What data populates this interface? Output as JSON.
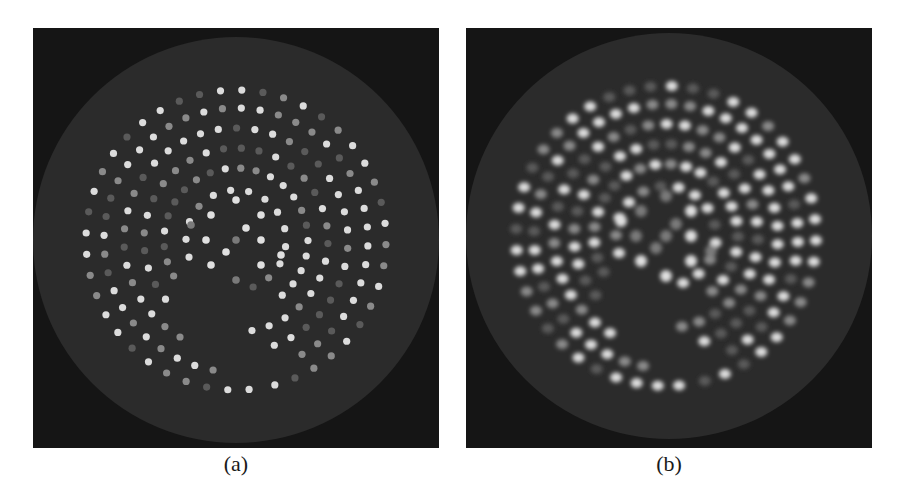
{
  "figure": {
    "panels": [
      {
        "id": "a",
        "caption": "(a)",
        "description": "Reconstructed slice: disk phantom with concentric rings of sharp bright dots"
      },
      {
        "id": "b",
        "caption": "(b)",
        "description": "Reconstructed slice: same phantom with blurred/smeared dots along arcs"
      }
    ]
  },
  "colors": {
    "background": "#151515",
    "disk": "#2b2b2b",
    "dot_bright": "#e6e6e6",
    "dot_dim": "#7a7a7a"
  }
}
